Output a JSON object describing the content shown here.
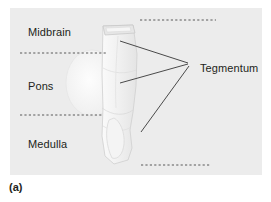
{
  "figure": {
    "caption": "(a)",
    "panel_background": "#ececec",
    "text_color": "#231f20",
    "illustration": {
      "name": "brainstem-sagittal-illustration",
      "description": "Pale sagittal view of the human brainstem column",
      "fill": "#f2f2f2",
      "outline": "#c9c9c9"
    },
    "labels": [
      {
        "id": "midbrain",
        "text": "Midbrain"
      },
      {
        "id": "pons",
        "text": "Pons"
      },
      {
        "id": "medulla",
        "text": "Medulla"
      },
      {
        "id": "tegmentum",
        "text": "Tegmentum"
      }
    ],
    "divider_lines": [
      {
        "id": "midbrain-pons-divider",
        "style": "dashed"
      },
      {
        "id": "pons-medulla-divider",
        "style": "dashed"
      },
      {
        "id": "top-right-divider",
        "style": "dashed"
      },
      {
        "id": "bottom-right-divider",
        "style": "dashed"
      }
    ],
    "leader_lines": {
      "name": "tegmentum-leader-lines",
      "count": 3,
      "color": "#4a4a4a",
      "converge_at": "Tegmentum label"
    }
  }
}
